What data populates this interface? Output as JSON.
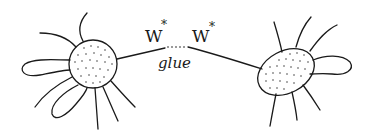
{
  "diagram": {
    "type": "hand-drawn sketch",
    "labels": {
      "left_operator": "W",
      "left_superscript": "*",
      "right_operator": "W",
      "right_superscript": "*",
      "connector": "glue"
    },
    "nodes": [
      {
        "id": "left-blob",
        "shape": "circle",
        "fill": "stippled",
        "legs": 8,
        "loops": 2
      },
      {
        "id": "right-blob",
        "shape": "ellipse",
        "fill": "stippled",
        "legs": 7,
        "loops": 1
      }
    ],
    "edges": [
      {
        "from": "left-blob",
        "to": "right-blob",
        "label": "glue",
        "style": "solid with dotted gap"
      }
    ],
    "colors": {
      "ink": "#1a1a1a",
      "background": "#ffffff"
    }
  }
}
